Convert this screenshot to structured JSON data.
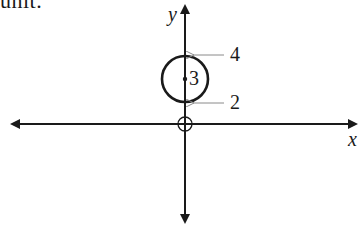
{
  "header": {
    "cutoff_text": "unit."
  },
  "axes": {
    "x_label": "x",
    "y_label": "y"
  },
  "circle": {
    "center_label": "3",
    "top_label": "4",
    "bottom_label": "2",
    "center_y_value": 3,
    "top_y_value": 4,
    "bottom_y_value": 2,
    "radius": 1
  },
  "origin": {
    "marker": "open-circle-crosshair"
  },
  "colors": {
    "ink": "#1a1a1a",
    "pointer_arrow": "#8a8a8a",
    "background": "#ffffff"
  }
}
